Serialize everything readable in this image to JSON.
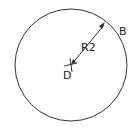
{
  "diagram": {
    "circle": {
      "cx": 71,
      "cy": 65,
      "r": 56,
      "stroke": "#333333"
    },
    "labels": {
      "radius": "R2",
      "point_edge": "B",
      "point_center": "D"
    }
  }
}
